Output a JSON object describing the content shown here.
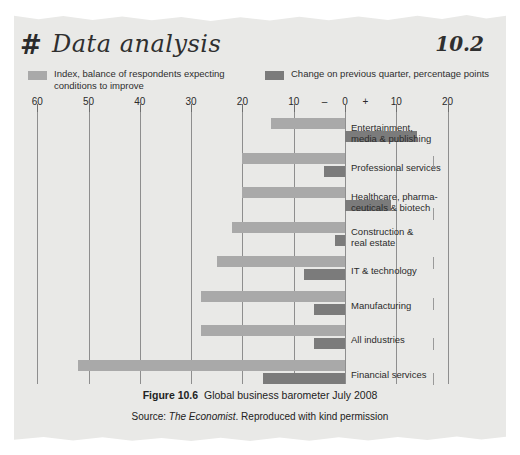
{
  "header": {
    "hash_icon": "#",
    "title": "Data analysis",
    "number": "10.2"
  },
  "legend": [
    {
      "label": "Index, balance of respondents expecting\nconditions to improve",
      "color": "#a9a9a9"
    },
    {
      "label": "Change on previous quarter, percentage points",
      "color": "#7b7b7b"
    }
  ],
  "caption": {
    "figure_label": "Figure 10.6",
    "figure_title": "Global business barometer July 2008",
    "source_prefix": "Source: ",
    "source_name": "The Economist",
    "source_suffix": ". Reproduced with kind permission"
  },
  "chart_data": {
    "type": "bar",
    "orientation": "horizontal",
    "title": "Global business barometer July 2008",
    "xlabel": "",
    "ylabel": "",
    "grid": true,
    "legend_position": "top",
    "axis_ticks": [
      {
        "label": "60",
        "value": -60
      },
      {
        "label": "50",
        "value": -50
      },
      {
        "label": "40",
        "value": -40
      },
      {
        "label": "30",
        "value": -30
      },
      {
        "label": "20",
        "value": -20
      },
      {
        "label": "10",
        "value": -10
      },
      {
        "label": "–",
        "value": -4
      },
      {
        "label": "0",
        "value": 0
      },
      {
        "label": "+",
        "value": 4
      },
      {
        "label": "10",
        "value": 10
      },
      {
        "label": "20",
        "value": 20
      }
    ],
    "xlim": [
      -60,
      24
    ],
    "categories": [
      "Entertainment,\nmedia & publishing",
      "Professional services",
      "Healthcare, pharma-\nceuticals & biotech",
      "Construction &\nreal estate",
      "IT & technology",
      "Manufacturing",
      "All industries",
      "Financial services"
    ],
    "series": [
      {
        "name": "Index, balance of respondents expecting conditions to improve",
        "color": "#a9a9a9",
        "values": [
          14.5,
          20.0,
          20.0,
          22.0,
          25.0,
          28.0,
          28.0,
          52.0
        ]
      },
      {
        "name": "Change on previous quarter, percentage points",
        "color": "#7b7b7b",
        "values": [
          14.0,
          -4.0,
          9.0,
          -2.0,
          -8.0,
          -6.0,
          -6.0,
          -16.0
        ]
      }
    ]
  }
}
